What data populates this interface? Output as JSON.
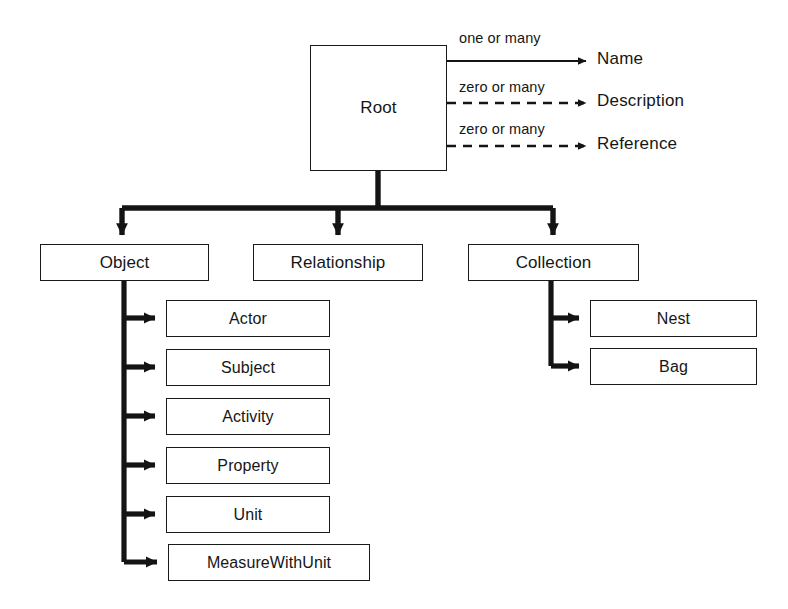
{
  "diagram": {
    "type": "hierarchy-tree",
    "root": {
      "label": "Root"
    },
    "attributes": [
      {
        "label": "Name",
        "cardinality": "one or many",
        "line_style": "solid"
      },
      {
        "label": "Description",
        "cardinality": "zero or many",
        "line_style": "dashed"
      },
      {
        "label": "Reference",
        "cardinality": "zero or many",
        "line_style": "dashed"
      }
    ],
    "branches": [
      {
        "label": "Object",
        "children": [
          {
            "label": "Actor"
          },
          {
            "label": "Subject"
          },
          {
            "label": "Activity"
          },
          {
            "label": "Property"
          },
          {
            "label": "Unit"
          },
          {
            "label": "MeasureWithUnit"
          }
        ]
      },
      {
        "label": "Relationship",
        "children": []
      },
      {
        "label": "Collection",
        "children": [
          {
            "label": "Nest"
          },
          {
            "label": "Bag"
          }
        ]
      }
    ],
    "colors": {
      "line": "#141414",
      "box_border": "#1a1a1a",
      "box_fill": "#ffffff",
      "text": "#161616",
      "background": "#ffffff"
    }
  }
}
